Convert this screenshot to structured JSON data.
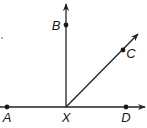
{
  "diagram": {
    "type": "geometry-rays",
    "vertex": {
      "label": "X",
      "x": 66,
      "y": 107
    },
    "points": [
      {
        "label": "A",
        "x": 7,
        "y": 107,
        "label_x": 7,
        "label_y": 122
      },
      {
        "label": "B",
        "x": 66,
        "y": 25,
        "label_x": 56,
        "label_y": 30
      },
      {
        "label": "C",
        "x": 123,
        "y": 50,
        "label_x": 131,
        "label_y": 58
      },
      {
        "label": "D",
        "x": 126,
        "y": 107,
        "label_x": 126,
        "label_y": 122
      }
    ],
    "vertex_label": {
      "text": "X",
      "x": 66,
      "y": 122
    },
    "rays": [
      {
        "name": "XB",
        "from": [
          66,
          107
        ],
        "to": [
          66,
          4
        ]
      },
      {
        "name": "XC",
        "from": [
          66,
          107
        ],
        "to": [
          138,
          34
        ]
      },
      {
        "name": "XD",
        "from": [
          0,
          107
        ],
        "to": [
          146,
          107
        ]
      }
    ],
    "line_color": "#222222",
    "point_color": "#1a1a1a"
  }
}
